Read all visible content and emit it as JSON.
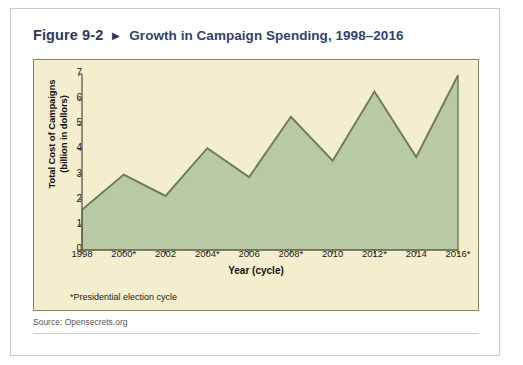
{
  "figure": {
    "number": "Figure 9-2",
    "arrow": "▶",
    "title": "Growth in Campaign Spending, 1998–2016",
    "footnote": "*Presidential election cycle",
    "source": "Source: Opensecrets.org"
  },
  "colors": {
    "title_navy": "#2f4470",
    "panel_background": "#f3eecd",
    "panel_border": "#8c8560",
    "area_fill": "#b9c9a4",
    "line_stroke": "#6b7d52",
    "axis": "#5a5a4a",
    "card_border": "#c9c9c9"
  },
  "chart_data": {
    "type": "area",
    "title": "Growth in Campaign Spending, 1998–2016",
    "xlabel": "Year (cycle)",
    "ylabel": "Total Cost of Campaigns (billion in dollors)",
    "ylabel_line1": "Total Cost of Campaigns",
    "ylabel_line2": "(billion in dollors)",
    "categories": [
      "1998",
      "2000*",
      "2002",
      "2004*",
      "2006",
      "2008*",
      "2010",
      "2012*",
      "2014",
      "2016*"
    ],
    "values": [
      1.6,
      3.0,
      2.15,
      4.05,
      2.9,
      5.3,
      3.55,
      6.3,
      3.7,
      6.95
    ],
    "ylim": [
      0,
      7
    ],
    "yticks": [
      0,
      1,
      2,
      3,
      4,
      5,
      6,
      7
    ],
    "ytick_labels": [
      "0",
      "1",
      "2",
      "3",
      "4",
      "5",
      "6",
      "7"
    ],
    "grid": false,
    "legend": "none",
    "annotation": "*Presidential election cycle",
    "source": "Source: Opensecrets.org"
  }
}
